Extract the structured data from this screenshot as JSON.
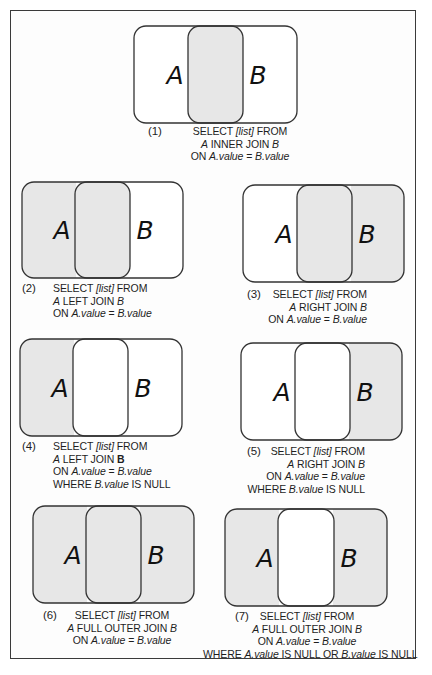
{
  "colors": {
    "fill": "#e7e7e7",
    "empty": "#ffffff",
    "stroke": "#333333",
    "frame_border": "#3a3a3a"
  },
  "labels": {
    "left_set": "A",
    "right_set": "B"
  },
  "diagrams": [
    {
      "id": 1,
      "number": "(1)",
      "join_type": "INNER JOIN",
      "box": {
        "x": 134,
        "y": 26,
        "w": 163,
        "h": 97
      },
      "overlap": {
        "x": 188,
        "w": 55
      },
      "fill": {
        "left_only": false,
        "overlap": true,
        "right_only": false
      },
      "caption_lines": [
        "SELECT [list] FROM",
        "A INNER JOIN B",
        "ON A.value = B.value"
      ],
      "caption_align": "center"
    },
    {
      "id": 2,
      "number": "(2)",
      "join_type": "LEFT JOIN",
      "box": {
        "x": 22,
        "y": 182,
        "w": 161,
        "h": 96
      },
      "overlap": {
        "x": 75,
        "w": 55
      },
      "fill": {
        "left_only": true,
        "overlap": true,
        "right_only": false
      },
      "caption_lines": [
        "SELECT [list] FROM",
        "A LEFT JOIN B",
        "ON A.value = B.value"
      ],
      "caption_align": "left"
    },
    {
      "id": 3,
      "number": "(3)",
      "join_type": "RIGHT JOIN",
      "box": {
        "x": 243,
        "y": 185,
        "w": 161,
        "h": 97
      },
      "overlap": {
        "x": 297,
        "w": 55
      },
      "fill": {
        "left_only": false,
        "overlap": true,
        "right_only": true
      },
      "caption_lines": [
        "SELECT [list] FROM",
        "A RIGHT JOIN B",
        "ON A.value = B.value"
      ],
      "caption_align": "right"
    },
    {
      "id": 4,
      "number": "(4)",
      "join_type": "LEFT JOIN",
      "box": {
        "x": 20,
        "y": 339,
        "w": 162,
        "h": 97
      },
      "overlap": {
        "x": 73,
        "w": 55
      },
      "fill": {
        "left_only": true,
        "overlap": false,
        "right_only": false
      },
      "caption_lines": [
        "SELECT [list] FROM",
        "A LEFT JOIN B",
        "ON A.value = B.value",
        "WHERE B.value IS NULL"
      ],
      "caption_align": "left"
    },
    {
      "id": 5,
      "number": "(5)",
      "join_type": "RIGHT JOIN",
      "box": {
        "x": 241,
        "y": 343,
        "w": 161,
        "h": 97
      },
      "overlap": {
        "x": 295,
        "w": 55
      },
      "fill": {
        "left_only": false,
        "overlap": false,
        "right_only": true
      },
      "caption_lines": [
        "SELECT [list] FROM",
        "A RIGHT JOIN B",
        "ON A.value = B.value",
        "WHERE B.value IS NULL"
      ],
      "caption_align": "right"
    },
    {
      "id": 6,
      "number": "(6)",
      "join_type": "FULL OUTER JOIN",
      "box": {
        "x": 33,
        "y": 506,
        "w": 161,
        "h": 97
      },
      "overlap": {
        "x": 86,
        "w": 55
      },
      "fill": {
        "left_only": true,
        "overlap": true,
        "right_only": true
      },
      "caption_lines": [
        "SELECT [list] FROM",
        "A FULL OUTER JOIN B",
        "ON A.value = B.value"
      ],
      "caption_align": "center"
    },
    {
      "id": 7,
      "number": "(7)",
      "join_type": "FULL OUTER JOIN",
      "box": {
        "x": 225,
        "y": 509,
        "w": 162,
        "h": 97
      },
      "overlap": {
        "x": 278,
        "w": 56
      },
      "fill": {
        "left_only": true,
        "overlap": false,
        "right_only": true
      },
      "caption_lines": [
        "SELECT [list] FROM",
        "A FULL OUTER JOIN B",
        "ON A.value = B.value",
        "WHERE A.value IS NULL OR B.value IS NULL"
      ],
      "caption_align": "center"
    }
  ],
  "captions": {
    "d1": {
      "num": "(1)",
      "l1": "SELECT [list] FROM",
      "l2": "A INNER JOIN B",
      "l3": "ON A.value = B.value"
    },
    "d2": {
      "num": "(2)",
      "l1": "SELECT [list] FROM",
      "l2": "A LEFT JOIN B",
      "l3": "ON A.value = B.value"
    },
    "d3": {
      "num": "(3)",
      "l1": "SELECT [list] FROM",
      "l2": "A RIGHT JOIN B",
      "l3": "ON A.value = B.value"
    },
    "d4": {
      "num": "(4)",
      "l1": "SELECT [list] FROM",
      "l2": "A LEFT JOIN B",
      "l3": "ON A.value = B.value",
      "l4": "WHERE B.value IS NULL"
    },
    "d5": {
      "num": "(5)",
      "l1": "SELECT [list] FROM",
      "l2": "A RIGHT JOIN B",
      "l3": "ON A.value = B.value",
      "l4": "WHERE B.value IS NULL"
    },
    "d6": {
      "num": "(6)",
      "l1": "SELECT [list] FROM",
      "l2": "A FULL OUTER JOIN B",
      "l3": "ON A.value = B.value"
    },
    "d7": {
      "num": "(7)",
      "l1": "SELECT [list] FROM",
      "l2": "A FULL OUTER JOIN B",
      "l3": "ON A.value = B.value",
      "l4": "WHERE A.value IS NULL OR B.value IS NULL"
    }
  }
}
